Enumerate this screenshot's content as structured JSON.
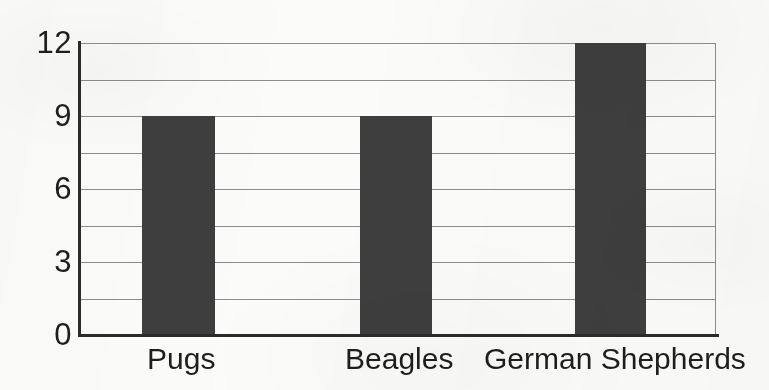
{
  "chart_data": {
    "type": "bar",
    "title": "",
    "subtitle": "",
    "xlabel": "",
    "ylabel": "",
    "categories": [
      "Pugs",
      "Beagles",
      "German Shepherds"
    ],
    "values": [
      9,
      9,
      12
    ],
    "series": [
      {
        "name": "Count",
        "values": [
          9,
          9,
          12
        ]
      }
    ],
    "ylim": [
      0,
      12
    ],
    "y_tick_labels": [
      "0",
      "3",
      "6",
      "9",
      "12"
    ],
    "y_tick_values": [
      0,
      3,
      6,
      9,
      12
    ],
    "gridline_values": [
      0,
      1.5,
      3,
      4.5,
      6,
      7.5,
      9,
      10.5,
      12
    ],
    "grid": "horizontal",
    "legend": "none",
    "legend_position": "none",
    "annotations": [],
    "bar_color": "#3e3e3e",
    "gridline_color": "#8d8d8d",
    "axis_color": "#2b2b2b",
    "background_color": "#fbfbfa",
    "text_color": "#1e1e1e"
  },
  "bars": [
    {
      "label": "Pugs",
      "value": 9,
      "left_px": 142,
      "width_px": 73,
      "label_center_px": 181
    },
    {
      "label": "Beagles",
      "value": 9,
      "left_px": 360,
      "width_px": 72,
      "label_center_px": 399
    },
    {
      "label": "German Shepherds",
      "value": 12,
      "left_px": 575,
      "width_px": 71,
      "label_center_px": 615
    }
  ]
}
